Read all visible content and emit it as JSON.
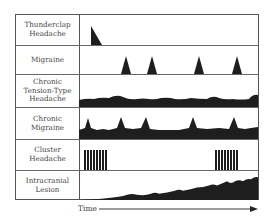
{
  "diagram": {
    "rows": [
      {
        "label_lines": [
          "Thunderclap",
          "Headache"
        ],
        "pattern": "single-onset-peak"
      },
      {
        "label_lines": [
          "Migraine"
        ],
        "pattern": "episodic-peaks"
      },
      {
        "label_lines": [
          "Chronic",
          "Tension-Type",
          "Headache"
        ],
        "pattern": "continuous-low-wavy"
      },
      {
        "label_lines": [
          "Chronic",
          "Migraine"
        ],
        "pattern": "continuous-with-peaks"
      },
      {
        "label_lines": [
          "Cluster",
          "Headache"
        ],
        "pattern": "clustered-bouts"
      },
      {
        "label_lines": [
          "Intracranial",
          "Lesion"
        ],
        "pattern": "progressive-increase"
      }
    ],
    "x_axis": {
      "label": "Time",
      "icon": "right-arrow-icon"
    },
    "colors": {
      "fill": "#1e1e1e",
      "border": "#555555",
      "text": "#444444"
    }
  }
}
